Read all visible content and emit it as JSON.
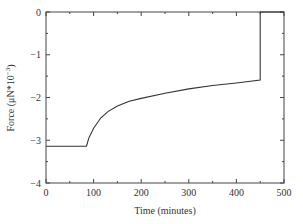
{
  "chart_data": {
    "type": "line",
    "title": "",
    "xlabel": "Time (minutes)",
    "ylabel": "Force (μN*10⁻³)",
    "ylabel_parts": {
      "main": "Force (μN*10",
      "sup": "−3",
      "close": ")"
    },
    "xlim": [
      0,
      500
    ],
    "ylim": [
      -4,
      0
    ],
    "xticks": [
      0,
      100,
      200,
      300,
      400,
      500
    ],
    "xtick_labels": [
      "0",
      "100",
      "200",
      "300",
      "400",
      "500"
    ],
    "yticks": [
      0,
      -1,
      -2,
      -3,
      -4
    ],
    "ytick_labels": [
      "0",
      "−1",
      "−2",
      "−3",
      "−4"
    ],
    "grid": false,
    "legend": null,
    "series": [
      {
        "name": "Force",
        "x": [
          0,
          85,
          90,
          100,
          115,
          130,
          150,
          175,
          200,
          250,
          300,
          350,
          400,
          450,
          450,
          452,
          500
        ],
        "y": [
          -3.14,
          -3.14,
          -2.95,
          -2.72,
          -2.48,
          -2.33,
          -2.2,
          -2.09,
          -2.02,
          -1.9,
          -1.8,
          -1.72,
          -1.66,
          -1.59,
          0,
          0,
          0
        ]
      }
    ]
  }
}
